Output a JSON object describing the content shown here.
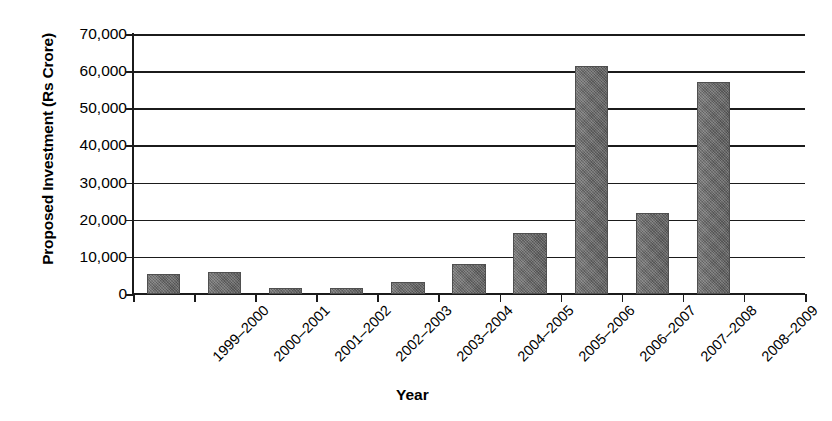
{
  "chart_data": {
    "type": "bar",
    "title": "",
    "xlabel": "Year",
    "ylabel": "Proposed Investment (Rs Crore)",
    "categories": [
      "1999–2000",
      "2000–2001",
      "2001–2002",
      "2002–2003",
      "2003–2004",
      "2004–2005",
      "2005–2006",
      "2006–2007",
      "2007–2008",
      "2008–2009"
    ],
    "values": [
      5400,
      6000,
      1700,
      1700,
      3300,
      8200,
      16500,
      61500,
      21800,
      57000
    ],
    "ylim": [
      0,
      70000
    ],
    "ytick_values": [
      0,
      10000,
      20000,
      30000,
      40000,
      50000,
      60000,
      70000
    ],
    "ytick_labels": [
      "0",
      "10,000",
      "20,000",
      "30,000",
      "40,000",
      "50,000",
      "60,000",
      "70,000"
    ],
    "grid": true,
    "legend": false,
    "bar_color": "#6e6e6e",
    "axis_color": "#1b1b1b",
    "background_color": "#ffffff",
    "empty_trailing_slot": true
  }
}
